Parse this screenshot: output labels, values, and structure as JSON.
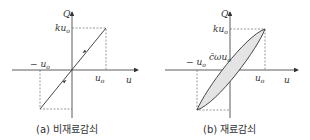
{
  "panels": [
    {
      "id": "a",
      "caption": "(a) 비재료감쇠",
      "y_axis_label": "Q",
      "x_axis_label": "u",
      "labels": {
        "q_top": "ku",
        "q_top_sub": "o",
        "x_pos": "u",
        "x_pos_sub": "o",
        "x_neg": "− u",
        "x_neg_sub": "o"
      }
    },
    {
      "id": "b",
      "caption": "(b) 재료감쇠",
      "y_axis_label": "Q",
      "x_axis_label": "u",
      "labels": {
        "q_top": "ku",
        "q_top_sub": "o",
        "q_mid": "c̄ωu",
        "q_mid_sub": "o",
        "x_pos": "u",
        "x_pos_sub": "o",
        "x_neg": "− u",
        "x_neg_sub": "o"
      }
    }
  ],
  "colors": {
    "line": "#333333",
    "dash": "#555555",
    "fill": "#e4e4e4"
  }
}
